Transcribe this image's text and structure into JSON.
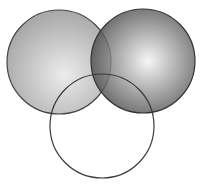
{
  "diagram": {
    "type": "venn",
    "background": "#ffffff",
    "circles": [
      {
        "id": "left",
        "cx": 59,
        "cy": 62,
        "r": 52,
        "fill_center": "#ececec",
        "fill_edge": "#a9a9a9",
        "highlight_fx": 0.55,
        "highlight_fy": 0.62,
        "stroke": "#444444",
        "opacity": 1
      },
      {
        "id": "right",
        "cx": 143,
        "cy": 61,
        "r": 52,
        "fill_center": "#f4f4f4",
        "fill_edge": "#3e3e3e",
        "highlight_fx": 0.55,
        "highlight_fy": 0.5,
        "stroke": "#333333",
        "opacity": 0.82
      },
      {
        "id": "bottom",
        "cx": 102,
        "cy": 126,
        "r": 52,
        "fill": "none",
        "stroke": "#3a3a3a"
      }
    ]
  }
}
